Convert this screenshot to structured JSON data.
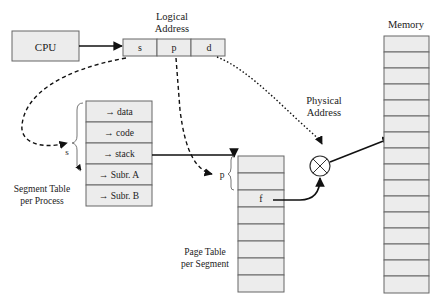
{
  "cpu": {
    "label": "CPU"
  },
  "logical_address": {
    "title_line1": "Logical",
    "title_line2": "Address",
    "fields": [
      "s",
      "p",
      "d"
    ]
  },
  "segment_table": {
    "title_line1": "Segment Table",
    "title_line2": "per Process",
    "brace_label": "s",
    "entries": [
      "→ data",
      "→ code",
      "→ stack",
      "→ Subr. A",
      "→ Subr. B"
    ]
  },
  "page_table": {
    "title_line1": "Page Table",
    "title_line2": "per Segment",
    "brace_label": "p",
    "frame_label": "f",
    "row_count": 10
  },
  "physical_address": {
    "title_line1": "Physical",
    "title_line2": "Address"
  },
  "memory": {
    "title": "Memory",
    "row_count": 16
  },
  "colors": {
    "box_fill": "#ececec",
    "box_stroke": "#666666",
    "line": "#111111"
  }
}
